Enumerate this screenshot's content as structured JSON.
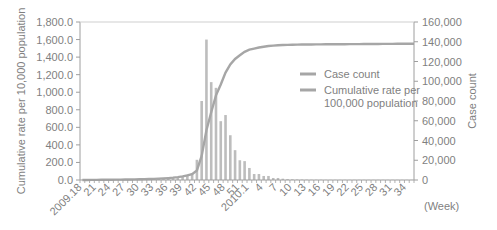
{
  "chart_data": {
    "type": "bar+line",
    "title": "",
    "xlabel": "(Week)",
    "ylabel_left": "Cumulative rate per 10,000 population",
    "ylabel_right": "Case count",
    "ylim_left": [
      0,
      1800
    ],
    "ylim_right": [
      0,
      160000
    ],
    "yticks_left": [
      "0.0",
      "200.0",
      "400.0",
      "600.0",
      "800.0",
      "1,000.0",
      "1,200.0",
      "1,400.0",
      "1,600.0",
      "1,800.0"
    ],
    "yticks_right": [
      "0",
      "20,000",
      "40,000",
      "60,000",
      "80,000",
      "100,000",
      "120,000",
      "140,000",
      "160,000"
    ],
    "xtick_labels": [
      "2009.18",
      "21",
      "24",
      "27",
      "30",
      "33",
      "36",
      "39",
      "42",
      "45",
      "48",
      "51",
      "2010.1",
      "4",
      "7",
      "10",
      "13",
      "16",
      "19",
      "22",
      "25",
      "28",
      "31",
      "34"
    ],
    "xtick_positions": [
      0,
      3,
      6,
      9,
      12,
      15,
      18,
      21,
      24,
      27,
      30,
      33,
      35,
      38,
      41,
      44,
      47,
      50,
      53,
      56,
      59,
      62,
      65,
      68
    ],
    "legend": [
      {
        "label": "Case count",
        "style": "bar"
      },
      {
        "label": "Cumulative rate per 100,000 population",
        "style": "line"
      }
    ],
    "legend_position": "center-right",
    "grid": false,
    "weeks": [
      "2009.18",
      "19",
      "20",
      "21",
      "22",
      "23",
      "24",
      "25",
      "26",
      "27",
      "28",
      "29",
      "30",
      "31",
      "32",
      "33",
      "34",
      "35",
      "36",
      "37",
      "38",
      "39",
      "40",
      "41",
      "42",
      "43",
      "44",
      "45",
      "46",
      "47",
      "48",
      "49",
      "50",
      "51",
      "52",
      "53",
      "2010.1",
      "2",
      "3",
      "4",
      "5",
      "6",
      "7",
      "8",
      "9",
      "10",
      "11",
      "12",
      "13",
      "14",
      "15",
      "16",
      "17",
      "18",
      "19",
      "20",
      "21",
      "22",
      "23",
      "24",
      "25",
      "26",
      "27",
      "28",
      "29",
      "30",
      "31",
      "32",
      "33",
      "34"
    ],
    "series": [
      {
        "name": "Case count",
        "type": "bar",
        "axis": "left",
        "values": [
          2,
          2,
          2,
          2,
          3,
          3,
          3,
          4,
          4,
          5,
          5,
          6,
          6,
          7,
          8,
          10,
          12,
          15,
          20,
          25,
          35,
          45,
          60,
          80,
          230,
          900,
          1600,
          1115,
          1050,
          670,
          740,
          510,
          340,
          225,
          215,
          137,
          68,
          68,
          46,
          46,
          23,
          23,
          15,
          10,
          8,
          6,
          5,
          4,
          3,
          3,
          3,
          2,
          2,
          2,
          2,
          2,
          2,
          2,
          2,
          2,
          2,
          2,
          2,
          2,
          2,
          2,
          2,
          2,
          2,
          2
        ]
      },
      {
        "name": "Cumulative rate per 100,000 population",
        "type": "line",
        "axis": "right",
        "plateau": 138000
      }
    ]
  }
}
